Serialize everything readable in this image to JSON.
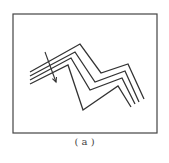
{
  "figure": {
    "caption": "( a )",
    "frame": {
      "x": 13,
      "y": 14,
      "w": 144,
      "h": 119
    },
    "stroke_color": "#333333",
    "lines": [
      "30,72 80,44 101,73 128,64 144,99",
      "30,76 75,52 95,82 125,71 139,102",
      "30,80 71,58 90,90 122,78 135,104",
      "30,84 68,65 83,110 118,86 131,107"
    ],
    "arrow": {
      "x1": 45,
      "y1": 52,
      "x2": 56,
      "y2": 82
    }
  }
}
